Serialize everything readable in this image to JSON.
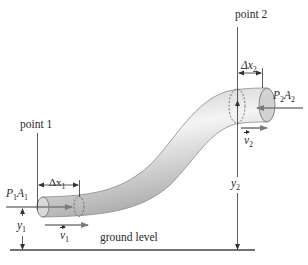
{
  "figure": {
    "labels": {
      "point1": "point 1",
      "point2": "point 2",
      "dx1": "Δx",
      "dx1_sub": "1",
      "dx2": "Δx",
      "dx2_sub": "2",
      "p1": "P",
      "p1_sub": "1",
      "a1": "A",
      "a1_sub": "1",
      "p2": "P",
      "p2_sub": "2",
      "a2": "A",
      "a2_sub": "2",
      "v1": "v",
      "v1_sub": "1",
      "v2": "v",
      "v2_sub": "2",
      "y1": "y",
      "y1_sub": "1",
      "y2": "y",
      "y2_sub": "2",
      "ground": "ground level"
    },
    "colors": {
      "pipe_light": "#f2f2f2",
      "pipe_mid": "#d4d4d4",
      "pipe_dark": "#a8a8a8",
      "arrow_gray": "#7a7a7a",
      "line": "#333333"
    }
  }
}
